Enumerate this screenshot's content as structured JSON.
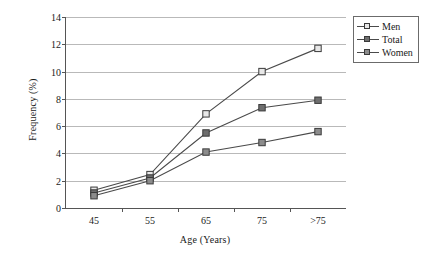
{
  "chart_data": {
    "type": "line",
    "title": "",
    "xlabel": "Age (Years)",
    "ylabel": "Frequency (%)",
    "categories": [
      "45",
      "55",
      "65",
      "75",
      ">75"
    ],
    "ylim": [
      0,
      14
    ],
    "yticks": [
      0,
      2,
      4,
      6,
      8,
      10,
      12,
      14
    ],
    "grid": true,
    "legend_position": "top-right",
    "series": [
      {
        "name": "Men",
        "values": [
          1.3,
          2.45,
          6.9,
          10.0,
          11.7
        ],
        "marker": "square",
        "marker_fill": "#e8e8e8",
        "line_color": "#4a4a4a"
      },
      {
        "name": "Total",
        "values": [
          1.1,
          2.2,
          5.5,
          7.35,
          7.9
        ],
        "marker": "square",
        "marker_fill": "#6e6e6e",
        "line_color": "#4a4a4a"
      },
      {
        "name": "Women",
        "values": [
          0.9,
          2.0,
          4.1,
          4.8,
          5.6
        ],
        "marker": "square",
        "marker_fill": "#8c8c8c",
        "line_color": "#4a4a4a"
      }
    ]
  },
  "legend": {
    "items": [
      {
        "label": "Men"
      },
      {
        "label": "Total"
      },
      {
        "label": "Women"
      }
    ]
  },
  "axis": {
    "y_tick_labels": [
      "0",
      "2",
      "4",
      "6",
      "8",
      "10",
      "12",
      "14"
    ],
    "x_tick_labels": [
      "45",
      "55",
      "65",
      "75",
      ">75"
    ]
  }
}
